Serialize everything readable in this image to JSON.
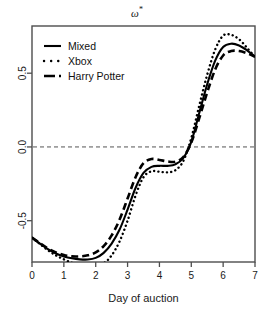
{
  "chart_data": {
    "type": "line",
    "title": "ω*",
    "title_base": "ω",
    "title_sup": "*",
    "xlabel": "Day of auction",
    "ylabel": "",
    "xlim": [
      0,
      7
    ],
    "ylim": [
      -0.78,
      0.82
    ],
    "xticks": [
      0,
      1,
      2,
      3,
      4,
      5,
      6,
      7
    ],
    "xtick_labels": [
      "0",
      "1",
      "2",
      "3",
      "4",
      "5",
      "6",
      "7"
    ],
    "yticks": [
      0.5,
      0.0,
      -0.5
    ],
    "ytick_labels": [
      "0.5",
      "0.0",
      "-0.5"
    ],
    "grid": false,
    "reference_lines": [
      {
        "name": "zero-line",
        "orientation": "horizontal",
        "value": 0.0,
        "style": "dashed",
        "color": "#555555"
      }
    ],
    "legend": {
      "position": "top-left",
      "entries": [
        {
          "label": "Mixed",
          "style": "solid",
          "color": "#000000"
        },
        {
          "label": "Xbox",
          "style": "dotted",
          "color": "#000000"
        },
        {
          "label": "Harry Potter",
          "style": "dashed",
          "color": "#000000"
        }
      ]
    },
    "x": [
      0,
      0.25,
      0.5,
      0.75,
      1,
      1.25,
      1.5,
      1.75,
      2,
      2.25,
      2.5,
      2.75,
      3,
      3.25,
      3.5,
      3.75,
      4,
      4.25,
      4.5,
      4.75,
      5,
      5.25,
      5.5,
      5.75,
      6,
      6.25,
      6.5,
      6.75,
      7
    ],
    "series": [
      {
        "name": "Mixed",
        "style": "solid",
        "color": "#000000",
        "values": [
          -0.615,
          -0.655,
          -0.693,
          -0.722,
          -0.742,
          -0.755,
          -0.762,
          -0.763,
          -0.752,
          -0.718,
          -0.655,
          -0.56,
          -0.425,
          -0.278,
          -0.176,
          -0.135,
          -0.128,
          -0.128,
          -0.118,
          -0.075,
          0.035,
          0.23,
          0.425,
          0.585,
          0.678,
          0.7,
          0.688,
          0.655,
          0.612
        ]
      },
      {
        "name": "Xbox",
        "style": "dotted",
        "color": "#000000",
        "values": [
          -0.615,
          -0.658,
          -0.7,
          -0.735,
          -0.762,
          -0.785,
          -0.8,
          -0.81,
          -0.812,
          -0.79,
          -0.735,
          -0.64,
          -0.5,
          -0.33,
          -0.205,
          -0.165,
          -0.168,
          -0.172,
          -0.158,
          -0.095,
          0.06,
          0.28,
          0.49,
          0.66,
          0.755,
          0.76,
          0.73,
          0.672,
          0.61
        ]
      },
      {
        "name": "Harry Potter",
        "style": "dashed",
        "color": "#000000",
        "values": [
          -0.615,
          -0.652,
          -0.688,
          -0.715,
          -0.733,
          -0.742,
          -0.742,
          -0.735,
          -0.715,
          -0.672,
          -0.6,
          -0.492,
          -0.35,
          -0.205,
          -0.11,
          -0.082,
          -0.088,
          -0.098,
          -0.1,
          -0.068,
          0.03,
          0.195,
          0.37,
          0.525,
          0.62,
          0.65,
          0.65,
          0.635,
          0.612
        ]
      }
    ]
  },
  "plot_box": {
    "left": 32,
    "top": 26,
    "right": 255,
    "bottom": 262
  }
}
